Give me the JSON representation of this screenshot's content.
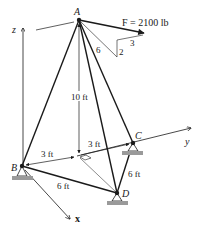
{
  "figure": {
    "type": "3D tripod truss diagram",
    "points": {
      "A": {
        "label": "A",
        "x": 79,
        "y": 20
      },
      "B": {
        "label": "B",
        "x": 22,
        "y": 166
      },
      "C": {
        "label": "C",
        "x": 133,
        "y": 143
      },
      "D": {
        "label": "D",
        "x": 117,
        "y": 193
      },
      "O": {
        "x": 77,
        "y": 156
      }
    },
    "force": {
      "label": "F = 2100 lb",
      "slope": {
        "hypotenuse": "6",
        "vertical": "2",
        "horizontal": "3"
      }
    },
    "axes": {
      "x": "x",
      "y": "y",
      "z": "z"
    },
    "dimensions": {
      "height": "10 ft",
      "BO": "3 ft",
      "OC": "3 ft",
      "BD": "6 ft",
      "CD": "6 ft"
    },
    "colors": {
      "line": "#1a1a1a",
      "support_ground": "#9a9a9a"
    }
  }
}
